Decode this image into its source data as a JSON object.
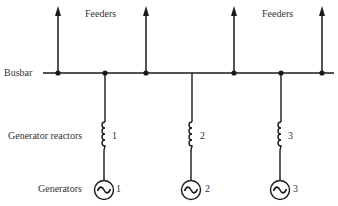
{
  "diagram": {
    "type": "single-line power system diagram",
    "labels": {
      "feeders_left": "Feeders",
      "feeders_right": "Feeders",
      "busbar": "Busbar",
      "generator_reactors": "Generator reactors",
      "generators": "Generators"
    },
    "reactor_numbers": [
      "1",
      "2",
      "3"
    ],
    "generator_numbers": [
      "1",
      "2",
      "3"
    ],
    "feeder_count": 4,
    "generator_count": 3,
    "line_color": "#1a1a1a"
  }
}
